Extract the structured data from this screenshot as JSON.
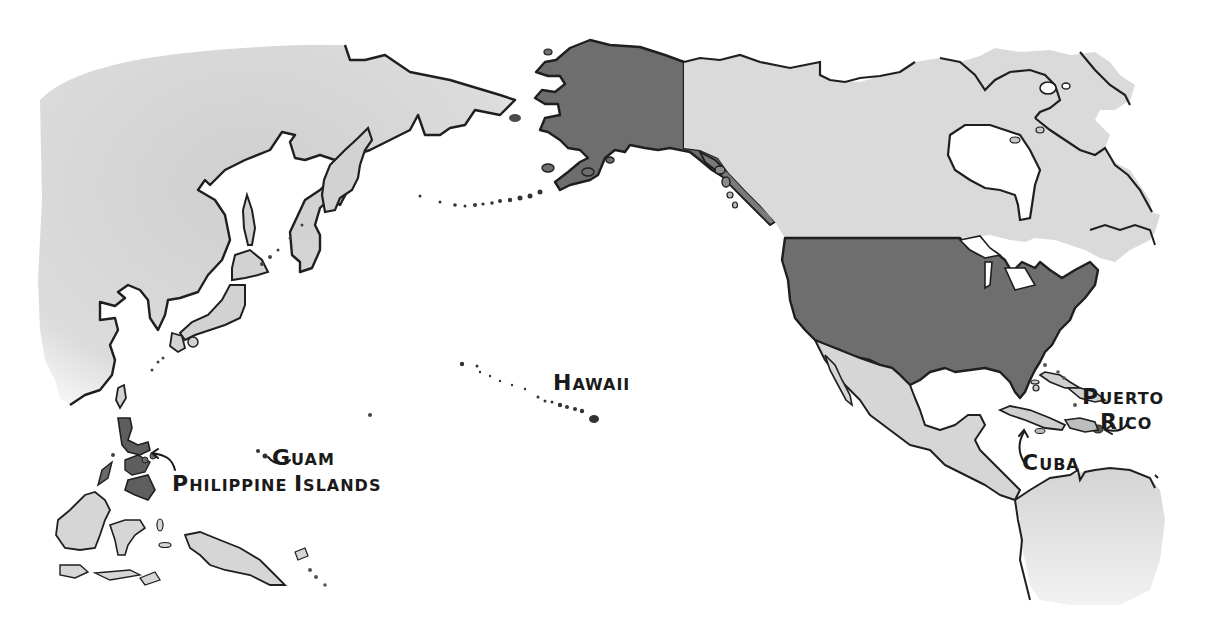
{
  "map": {
    "style": "hand-drawn grayscale map of the Pacific and North America",
    "colors": {
      "ocean": "#ffffff",
      "foreign_land": "#d9d9d9",
      "foreign_land_shadow": "#c4c4c4",
      "us_territory": "#6e6e6e",
      "coastline": "#1f1f1f"
    },
    "regions": [
      {
        "name": "Asia",
        "shaded_as": "foreign"
      },
      {
        "name": "Japan",
        "shaded_as": "foreign"
      },
      {
        "name": "Indonesia / New Guinea",
        "shaded_as": "foreign"
      },
      {
        "name": "Canada",
        "shaded_as": "foreign"
      },
      {
        "name": "Mexico & Central America",
        "shaded_as": "foreign"
      },
      {
        "name": "South America",
        "shaded_as": "foreign"
      },
      {
        "name": "Alaska",
        "shaded_as": "us"
      },
      {
        "name": "United States",
        "shaded_as": "us"
      },
      {
        "name": "Philippine Islands",
        "shaded_as": "us"
      },
      {
        "name": "Hawaii",
        "shaded_as": "us"
      },
      {
        "name": "Guam",
        "shaded_as": "us"
      },
      {
        "name": "Puerto Rico",
        "shaded_as": "us"
      },
      {
        "name": "Cuba",
        "shaded_as": "foreign"
      }
    ],
    "labels": {
      "hawaii": {
        "first": "H",
        "rest": "AWAII"
      },
      "guam": {
        "first": "G",
        "rest": "UAM"
      },
      "philippines_1": {
        "first": "P",
        "rest": "HILIPPINE "
      },
      "philippines_2": {
        "first": "I",
        "rest": "SLANDS"
      },
      "puerto": {
        "first": "P",
        "rest": "UERTO"
      },
      "rico": {
        "first": "R",
        "rest": "ICO"
      },
      "cuba": {
        "first": "C",
        "rest": "UBA"
      }
    }
  }
}
